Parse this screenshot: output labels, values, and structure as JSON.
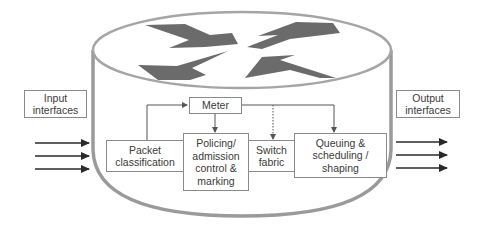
{
  "diagram": {
    "colors": {
      "cylinder_outline": "#9a9a9a",
      "router_arrows": "#6b6b6b",
      "box_border": "#8a8a8a",
      "text": "#3a3a3a",
      "connector": "#555555",
      "io_arrows": "#2a2a2a"
    },
    "nodes": {
      "input_interfaces": {
        "label": "Input\ninterfaces"
      },
      "output_interfaces": {
        "label": "Output\ninterfaces"
      },
      "meter": {
        "label": "Meter"
      },
      "packet_classification": {
        "label": "Packet\nclassification"
      },
      "policing": {
        "label": "Policing/\nadmission\ncontrol &\nmarking"
      },
      "switch_fabric": {
        "label": "Switch\nfabric"
      },
      "queuing": {
        "label": "Queuing &\nscheduling /\nshaping"
      }
    },
    "edges": [
      {
        "from": "packet_classification",
        "to": "meter",
        "style": "solid"
      },
      {
        "from": "meter",
        "to": "policing",
        "style": "solid"
      },
      {
        "from": "meter",
        "to": "switch_fabric",
        "style": "dotted"
      },
      {
        "from": "meter",
        "to": "queuing",
        "style": "solid"
      },
      {
        "from": "packet_classification",
        "to": "policing",
        "style": "solid"
      },
      {
        "from": "policing",
        "to": "switch_fabric",
        "style": "solid"
      },
      {
        "from": "switch_fabric",
        "to": "queuing",
        "style": "solid"
      }
    ],
    "input_arrow_count": 3,
    "output_arrow_count": 3,
    "router_icon": "router-cylinder-icon"
  }
}
